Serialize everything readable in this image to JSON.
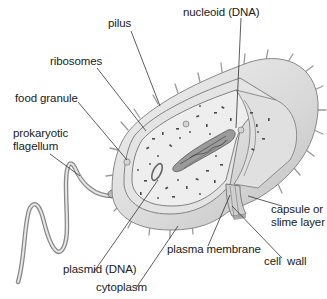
{
  "diagram": {
    "labels": {
      "pilus": "pilus",
      "nucleoid": "nucleoid (DNA)",
      "ribosomes": "ribosomes",
      "food_granule": "food granule",
      "flagellum_line1": "prokaryotic",
      "flagellum_line2": "flagellum",
      "capsule_line1": "capsule or",
      "capsule_line2": "slime layer",
      "plasma_membrane": "plasma membrane",
      "cell_wall": "cell  wall",
      "plasmid": "plasmid (DNA)",
      "cytoplasm": "cytoplasm"
    },
    "colors": {
      "background": "#ffffff",
      "text": "#1a1a1a",
      "leader_line": "#333333",
      "capsule": "#d9d9d9",
      "cytoplasm": "#e8e8e8",
      "nucleoid": "#8a8a8a",
      "ribosome": "#4a4a4a"
    }
  }
}
